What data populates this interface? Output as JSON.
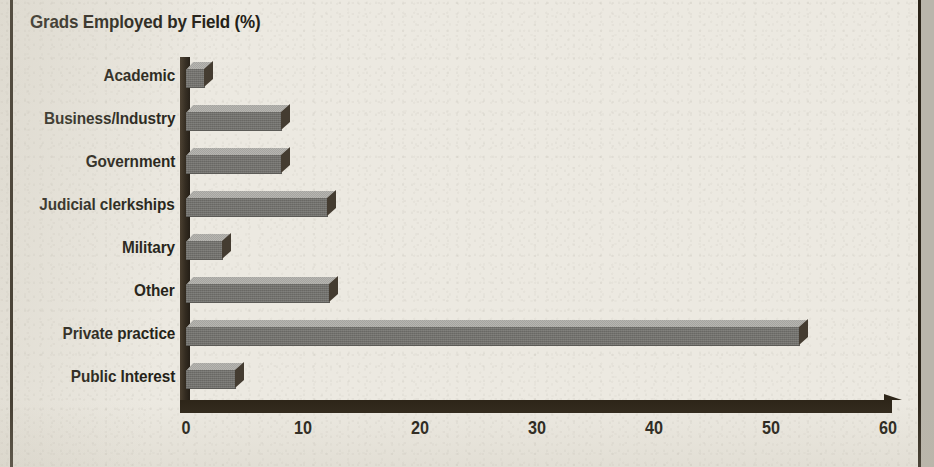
{
  "chart_data": {
    "type": "bar",
    "orientation": "horizontal",
    "title": "Grads Employed by Field (%)",
    "xlabel": "",
    "ylabel": "",
    "xlim": [
      0,
      60
    ],
    "xticks": [
      0,
      10,
      20,
      30,
      40,
      50,
      60
    ],
    "xtick_labels": [
      "0",
      "10",
      "20",
      "30",
      "40",
      "50",
      "60"
    ],
    "grid": false,
    "legend": false,
    "style": "3d-bars",
    "categories": [
      "Academic",
      "Business/Industry",
      "Government",
      "Judicial clerkships",
      "Military",
      "Other",
      "Private practice",
      "Public Interest"
    ],
    "values": [
      1.6,
      8.2,
      8.2,
      12.1,
      3.2,
      12.3,
      52.5,
      4.3
    ],
    "series": [
      {
        "name": "Grads Employed by Field (%)",
        "values": [
          1.6,
          8.2,
          8.2,
          12.1,
          3.2,
          12.3,
          52.5,
          4.3
        ]
      }
    ]
  },
  "colors": {
    "paper": "#ece9e1",
    "ink": "#241f17",
    "bar_front": "#71706c",
    "bar_top": "#a6a5a0",
    "bar_side": "#3a332a",
    "axis": "#2e2619",
    "rule": "#2b2419",
    "gutter": "#b9b5ab"
  }
}
